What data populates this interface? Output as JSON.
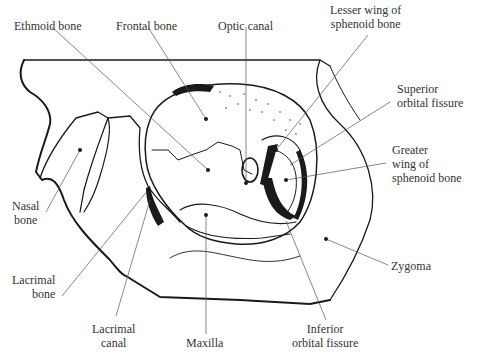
{
  "figure": {
    "labels": {
      "ethmoid": "Ethmoid bone",
      "frontal": "Frontal bone",
      "optic": "Optic canal",
      "lesser1": "Lesser wing of",
      "lesser2": "sphenoid bone",
      "sof1": "Superior",
      "sof2": "orbital fissure",
      "greater1": "Greater",
      "greater2": "wing of",
      "greater3": "sphenoid bone",
      "nasal1": "Nasal",
      "nasal2": "bone",
      "zygoma": "Zygoma",
      "lacbone1": "Lacrimal",
      "lacbone2": "bone",
      "laccanal1": "Lacrimal",
      "laccanal2": "canal",
      "maxilla": "Maxilla",
      "iof1": "Inferior",
      "iof2": "orbital fissure"
    },
    "colors": {
      "ink": "#1a1a1a",
      "leader": "#555555",
      "text": "#333333"
    }
  }
}
